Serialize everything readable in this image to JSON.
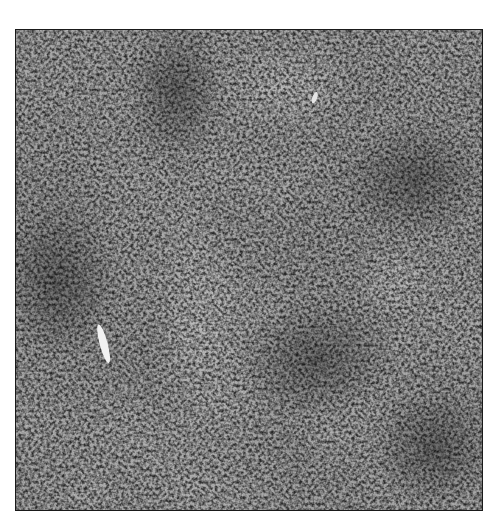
{
  "image": {
    "description": "Grayscale histology micrograph showing densely packed round cells with scattered lighter and darker regions and a bright elongated structure at left-center",
    "alt": "Histology micrograph of dense cellular tissue",
    "colors": {
      "background": "#ffffff",
      "border": "#1a1a1a",
      "tissue_mid": "#8a8a8a",
      "nuclei_dark": "#3a3a3a",
      "highlight": "#e8e8e8"
    }
  }
}
